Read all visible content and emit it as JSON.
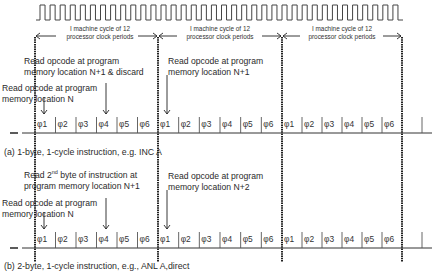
{
  "clock": {
    "label": "processor clock waveform",
    "periods": 36,
    "x_start": 40,
    "x_end": 403
  },
  "machine_cycles": [
    {
      "line1": "I machine cycle of 12",
      "line2": "processor clock periods"
    },
    {
      "line1": "I machine cycle of 12",
      "line2": "processor clock periods"
    },
    {
      "line1": "I machine cycle of 12",
      "line2": "processor clock periods"
    }
  ],
  "phases": [
    "φ1",
    "φ2",
    "φ3",
    "φ4",
    "φ5",
    "φ6"
  ],
  "diagram_a": {
    "caption": "(a)  1-byte, 1-cycle instruction, e.g. INC A",
    "annotations": [
      {
        "line1": "Read opcode at program",
        "line2": "memory location N+1 & discard"
      },
      {
        "line1": "Read opcode at program",
        "line2": "memory location N"
      },
      {
        "line1": "Read opcode at program",
        "line2": "memory location N+1"
      }
    ]
  },
  "diagram_b": {
    "caption": "(b)  2-byte, 1-cycle instruction, e.g., ANL A,direct",
    "annotations": [
      {
        "line1_pre": "Read 2",
        "line1_sup": "nd",
        "line1_post": " byte of instruction at",
        "line2": "program memory location N+1"
      },
      {
        "line1": "Read opcode at program",
        "line2": "memory location N"
      },
      {
        "line1": "Read opcode at program",
        "line2": "memory location N+2"
      }
    ]
  }
}
